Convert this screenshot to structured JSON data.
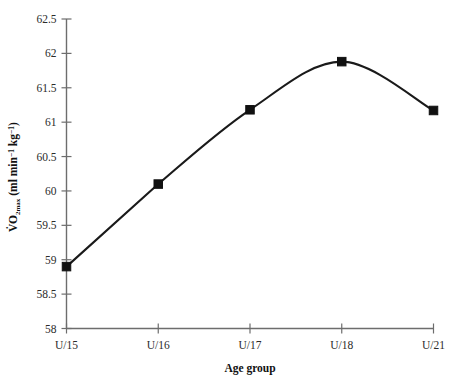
{
  "chart_data": {
    "type": "line",
    "title": "",
    "subtitle": "",
    "xlabel": "Age group",
    "ylabel": "VO2max (ml min-1 kg-1)",
    "ylabel_parts": {
      "dot_v": "V",
      "o": "O",
      "o_sub": "2max",
      "units_open": " (ml min",
      "units_sup1": "−1",
      "units_mid": " kg",
      "units_sup2": "−1",
      "units_close": ")"
    },
    "categories": [
      "U/15",
      "U/16",
      "U/17",
      "U/18",
      "U/21"
    ],
    "values": [
      58.9,
      60.1,
      61.18,
      61.88,
      61.17
    ],
    "series": [
      {
        "name": "VO2max",
        "values": [
          58.9,
          60.1,
          61.18,
          61.88,
          61.17
        ]
      }
    ],
    "ylim": [
      58,
      62.5
    ],
    "yticks": [
      58,
      58.5,
      59,
      59.5,
      60,
      60.5,
      61,
      61.5,
      62,
      62.5
    ],
    "ytick_labels": [
      "58",
      "58.5",
      "59",
      "59.5",
      "60",
      "60.5",
      "61",
      "61.5",
      "62",
      "62.5"
    ],
    "xtick_labels": [
      "U/15",
      "U/16",
      "U/17",
      "U/18",
      "U/21"
    ],
    "grid": false,
    "legend": false,
    "legend_position": "none",
    "marker": "square",
    "line_style": "smooth-spline",
    "colors": {
      "line": "#1a1a1a",
      "marker": "#111111",
      "axis": "#6d6d6d",
      "text": "#2b2b2b",
      "background": "#ffffff"
    }
  }
}
